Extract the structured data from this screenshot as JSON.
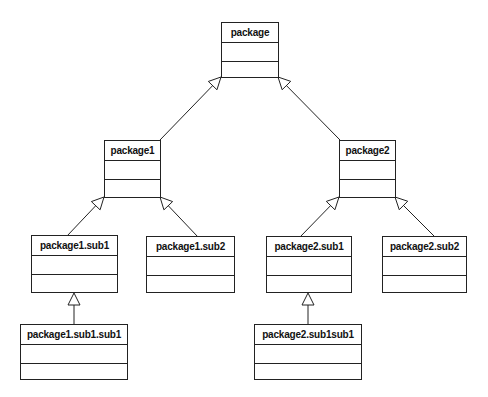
{
  "diagram": {
    "type": "uml-package-inheritance",
    "colors": {
      "stroke": "#222222",
      "fill": "#ffffff",
      "text": "#111111"
    },
    "nodes": [
      {
        "id": "package",
        "label": "package",
        "x": 221,
        "y": 22,
        "w": 58,
        "h": 56
      },
      {
        "id": "package1",
        "label": "package1",
        "x": 104,
        "y": 140,
        "w": 57,
        "h": 58
      },
      {
        "id": "package2",
        "label": "package2",
        "x": 339,
        "y": 140,
        "w": 57,
        "h": 58
      },
      {
        "id": "package1.sub1",
        "label": "package1.sub1",
        "x": 31,
        "y": 235,
        "w": 87,
        "h": 58
      },
      {
        "id": "package1.sub2",
        "label": "package1.sub2",
        "x": 146,
        "y": 236,
        "w": 89,
        "h": 57
      },
      {
        "id": "package2.sub1",
        "label": "package2.sub1",
        "x": 266,
        "y": 236,
        "w": 86,
        "h": 57
      },
      {
        "id": "package2.sub2",
        "label": "package2.sub2",
        "x": 382,
        "y": 236,
        "w": 85,
        "h": 57
      },
      {
        "id": "package1.sub1.sub1",
        "label": "package1.sub1.sub1",
        "x": 20,
        "y": 324,
        "w": 108,
        "h": 56
      },
      {
        "id": "package2.sub1sub1",
        "label": "package2.sub1sub1",
        "x": 254,
        "y": 324,
        "w": 108,
        "h": 56
      }
    ],
    "edges": [
      {
        "from": "package1",
        "to": "package",
        "x1": 160,
        "y1": 140,
        "x2": 221,
        "y2": 77
      },
      {
        "from": "package2",
        "to": "package",
        "x1": 340,
        "y1": 140,
        "x2": 278,
        "y2": 77
      },
      {
        "from": "package1.sub1",
        "to": "package1",
        "x1": 67,
        "y1": 236,
        "x2": 104,
        "y2": 197
      },
      {
        "from": "package1.sub2",
        "to": "package1",
        "x1": 198,
        "y1": 237,
        "x2": 160,
        "y2": 197
      },
      {
        "from": "package2.sub1",
        "to": "package2",
        "x1": 300,
        "y1": 237,
        "x2": 339,
        "y2": 197
      },
      {
        "from": "package2.sub2",
        "to": "package2",
        "x1": 435,
        "y1": 237,
        "x2": 395,
        "y2": 197
      },
      {
        "from": "package1.sub1.sub1",
        "to": "package1.sub1",
        "x1": 74,
        "y1": 324,
        "x2": 74,
        "y2": 293
      },
      {
        "from": "package2.sub1sub1",
        "to": "package2.sub1",
        "x1": 308,
        "y1": 324,
        "x2": 308,
        "y2": 293
      }
    ],
    "edge_style": "generalization-hollow-triangle"
  }
}
